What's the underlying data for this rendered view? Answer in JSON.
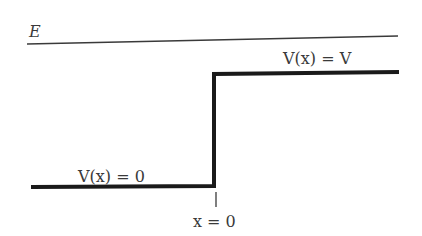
{
  "diagram": {
    "energy_label": "E",
    "region_right_label": "V(x) = V",
    "region_left_label": "V(x) = 0",
    "origin_label": "x = 0",
    "colors": {
      "line": "#1a1a1a",
      "energy_line": "#3a3a3a",
      "text": "#3a3a3a",
      "background": "#ffffff"
    }
  }
}
